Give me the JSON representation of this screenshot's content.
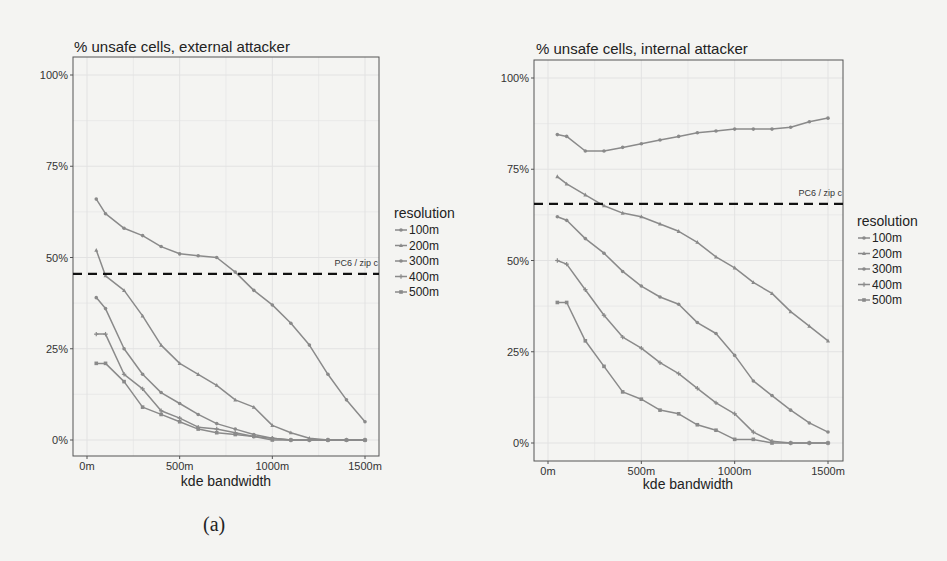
{
  "chart_data": [
    {
      "id": "a",
      "type": "line",
      "title": "% unsafe cells, external attacker",
      "xlabel": "kde bandwidth",
      "ylabel": "",
      "caption": "(a)",
      "x": [
        50,
        100,
        200,
        300,
        400,
        500,
        600,
        700,
        800,
        900,
        1000,
        1100,
        1200,
        1300,
        1400,
        1500
      ],
      "x_ticks": [
        "0m",
        "500m",
        "1000m",
        "1500m"
      ],
      "x_tick_values": [
        0,
        500,
        1000,
        1500
      ],
      "y_ticks": [
        "0%",
        "25%",
        "50%",
        "75%",
        "100%"
      ],
      "y_tick_values": [
        0,
        25,
        50,
        75,
        100
      ],
      "xlim": [
        -50,
        1550
      ],
      "ylim": [
        0,
        100
      ],
      "grid": true,
      "legend": {
        "title": "resolution",
        "position": "right"
      },
      "reference_line": {
        "value": 45.5,
        "label": "PC6 / zip c",
        "style": "dashed"
      },
      "series": [
        {
          "name": "100m",
          "values": [
            66,
            62,
            58,
            56,
            53,
            51,
            50.5,
            50,
            46,
            41,
            37,
            32,
            26,
            18,
            11,
            5
          ]
        },
        {
          "name": "200m",
          "values": [
            52,
            45,
            41,
            34,
            26,
            21,
            18,
            15,
            11,
            9,
            4,
            2,
            0.5,
            0,
            0,
            0
          ]
        },
        {
          "name": "300m",
          "values": [
            39,
            36,
            25,
            18,
            13,
            10,
            7,
            4.5,
            3,
            1.5,
            0.5,
            0,
            0,
            0,
            0,
            0
          ]
        },
        {
          "name": "400m",
          "values": [
            29,
            29,
            18,
            14,
            8,
            6,
            3.5,
            3,
            2,
            1,
            0.5,
            0,
            0,
            0,
            0,
            0
          ]
        },
        {
          "name": "500m",
          "values": [
            21,
            21,
            16,
            9,
            7,
            5,
            3,
            2,
            1.5,
            1,
            0,
            0,
            0,
            0,
            0,
            0
          ]
        }
      ]
    },
    {
      "id": "b",
      "type": "line",
      "title": "% unsafe cells, internal attacker",
      "xlabel": "kde bandwidth",
      "ylabel": "",
      "caption": "(b)",
      "x": [
        50,
        100,
        200,
        300,
        400,
        500,
        600,
        700,
        800,
        900,
        1000,
        1100,
        1200,
        1300,
        1400,
        1500
      ],
      "x_ticks": [
        "0m",
        "500m",
        "1000m",
        "1500m"
      ],
      "x_tick_values": [
        0,
        500,
        1000,
        1500
      ],
      "y_ticks": [
        "0%",
        "25%",
        "50%",
        "75%",
        "100%"
      ],
      "y_tick_values": [
        0,
        25,
        50,
        75,
        100
      ],
      "xlim": [
        -50,
        1550
      ],
      "ylim": [
        0,
        100
      ],
      "grid": true,
      "legend": {
        "title": "resolution",
        "position": "right"
      },
      "reference_line": {
        "value": 65.5,
        "label": "PC6 / zip c",
        "style": "dashed"
      },
      "series": [
        {
          "name": "100m",
          "values": [
            84.5,
            84,
            80,
            80,
            81,
            82,
            83,
            84,
            85,
            85.5,
            86,
            86,
            86,
            86.5,
            88,
            89
          ]
        },
        {
          "name": "200m",
          "values": [
            73,
            71,
            68,
            65,
            63,
            62,
            60,
            58,
            55,
            51,
            48,
            44,
            41,
            36,
            32,
            28
          ]
        },
        {
          "name": "300m",
          "values": [
            62,
            61,
            56,
            52,
            47,
            43,
            40,
            38,
            33,
            30,
            24,
            17,
            13,
            9,
            5.5,
            3
          ]
        },
        {
          "name": "400m",
          "values": [
            50,
            49,
            42,
            35,
            29,
            26,
            22,
            19,
            15,
            11,
            8,
            3,
            0.5,
            0,
            0,
            0
          ]
        },
        {
          "name": "500m",
          "values": [
            38.5,
            38.5,
            28,
            21,
            14,
            12,
            9,
            8,
            5,
            3.5,
            1,
            1,
            0,
            0,
            0,
            0
          ]
        }
      ]
    }
  ],
  "layout": {
    "a": {
      "box": [
        73,
        57,
        379,
        456
      ],
      "x0px": 87,
      "x1500px": 365,
      "y0px": 440,
      "y100px": 75
    },
    "b": {
      "box": [
        64,
        60,
        373,
        461
      ],
      "x0px": 78,
      "x1500px": 358,
      "y0px": 443,
      "y100px": 78
    }
  },
  "colors": {
    "series": "#8a8a8a",
    "reference_line": "#111111",
    "grid": "#e2e2e2",
    "axis": "#555555"
  }
}
